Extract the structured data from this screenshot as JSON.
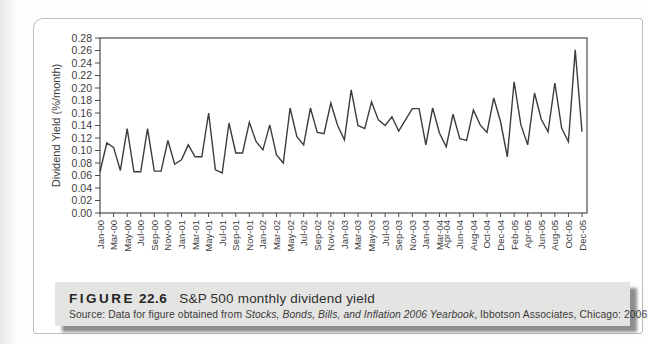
{
  "figure": {
    "label": "FIGURE",
    "number": "22.6",
    "title": "S&P 500 monthly dividend yield",
    "source_prefix": "Source: Data for figure obtained from ",
    "source_italic": "Stocks, Bonds, Bills, and Inflation 2006 Yearbook",
    "source_suffix": ", Ibbotson Associates, Chicago: 2006"
  },
  "chart_data": {
    "type": "line",
    "title": "",
    "xlabel": "",
    "ylabel": "Dividend Yield (%/month)",
    "ylim": [
      0.0,
      0.28
    ],
    "ytick_step": 0.02,
    "grid": false,
    "legend": "none",
    "y_tick_labels": [
      "0.00",
      "0.02",
      "0.04",
      "0.06",
      "0.08",
      "0.10",
      "0.12",
      "0.14",
      "0.16",
      "0.18",
      "0.20",
      "0.22",
      "0.24",
      "0.26",
      "0.28"
    ],
    "x": [
      "Jan-00",
      "Feb-00",
      "Mar-00",
      "Apr-00",
      "May-00",
      "Jun-00",
      "Jul-00",
      "Aug-00",
      "Sep-00",
      "Oct-00",
      "Nov-00",
      "Dec-00",
      "Jan-01",
      "Feb-01",
      "Mar-01",
      "Apr-01",
      "May-01",
      "Jun-01",
      "Jul-01",
      "Aug-01",
      "Sep-01",
      "Oct-01",
      "Nov-01",
      "Dec-01",
      "Jan-02",
      "Feb-02",
      "Mar-02",
      "Apr-02",
      "May-02",
      "Jun-02",
      "Jul-02",
      "Aug-02",
      "Sep-02",
      "Oct-02",
      "Nov-02",
      "Dec-02",
      "Jan-03",
      "Feb-03",
      "Mar-03",
      "Apr-03",
      "May-03",
      "Jun-03",
      "Jul-03",
      "Aug-03",
      "Sep-03",
      "Oct-03",
      "Nov-03",
      "Dec-03",
      "Jan-04",
      "Feb-04",
      "Mar-04",
      "Apr-04",
      "May-04",
      "Jun-04",
      "Jul-04",
      "Aug-04",
      "Sep-04",
      "Oct-04",
      "Nov-04",
      "Dec-04",
      "Jan-05",
      "Feb-05",
      "Mar-05",
      "Apr-05",
      "May-05",
      "Jun-05",
      "Jul-05",
      "Aug-05",
      "Sep-05",
      "Oct-05",
      "Nov-05",
      "Dec-05"
    ],
    "values": [
      0.066,
      0.112,
      0.105,
      0.068,
      0.135,
      0.066,
      0.066,
      0.135,
      0.067,
      0.067,
      0.116,
      0.078,
      0.085,
      0.109,
      0.09,
      0.09,
      0.16,
      0.069,
      0.064,
      0.144,
      0.096,
      0.096,
      0.145,
      0.114,
      0.101,
      0.141,
      0.093,
      0.08,
      0.168,
      0.122,
      0.109,
      0.168,
      0.129,
      0.127,
      0.176,
      0.14,
      0.117,
      0.197,
      0.14,
      0.135,
      0.178,
      0.149,
      0.14,
      0.154,
      0.131,
      0.149,
      0.167,
      0.167,
      0.109,
      0.168,
      0.128,
      0.106,
      0.158,
      0.119,
      0.116,
      0.165,
      0.141,
      0.129,
      0.184,
      0.146,
      0.09,
      0.21,
      0.141,
      0.109,
      0.192,
      0.15,
      0.13,
      0.208,
      0.136,
      0.114,
      0.261,
      0.13
    ],
    "x_tick_labels": [
      "Jan-00",
      "Mar-00",
      "May-00",
      "Jul-00",
      "Sep-00",
      "Nov-00",
      "Jan-01",
      "Mar-01",
      "May-01",
      "Jul-01",
      "Sep-01",
      "Nov-01",
      "Jan-02",
      "Mar-02",
      "May-02",
      "Jul-02",
      "Sep-02",
      "Nov-02",
      "Jan-03",
      "Mar-03",
      "May-03",
      "Jul-03",
      "Sep-03",
      "Nov-03",
      "Jan-04",
      "Mar-04",
      "Apr-04",
      "Jun-04",
      "Aug-04",
      "Oct-04",
      "Dec-04",
      "Feb-05",
      "Apr-05",
      "Jun-05",
      "Aug-05",
      "Oct-05",
      "Dec-05"
    ],
    "colors": {
      "line": "#3c3c3c",
      "axis": "#4d4d4d",
      "tick_text": "#3c3c3c"
    }
  }
}
